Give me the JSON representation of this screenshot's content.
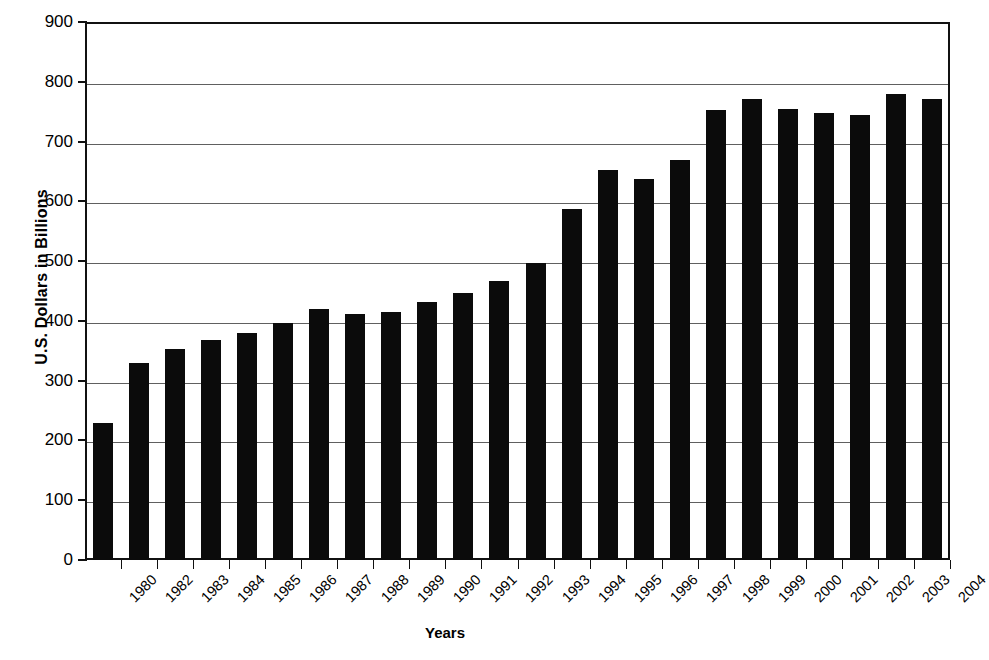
{
  "chart_data": {
    "type": "bar",
    "title": "",
    "xlabel": "Years",
    "ylabel": "U.S. Dollars in Billions",
    "ylim": [
      0,
      900
    ],
    "ytick_step": 100,
    "yticks": [
      900,
      800,
      700,
      600,
      500,
      400,
      300,
      200,
      100,
      0
    ],
    "grid": true,
    "legend": "none",
    "bar_color": "#0b0b0b",
    "categories": [
      "1980",
      "1982",
      "1983",
      "1984",
      "1985",
      "1986",
      "1987",
      "1988",
      "1989",
      "1990",
      "1991",
      "1992",
      "1993",
      "1994",
      "1995",
      "1996",
      "1997",
      "1998",
      "1999",
      "2000",
      "2001",
      "2002",
      "2003",
      "2004"
    ],
    "values": [
      230,
      330,
      353,
      368,
      380,
      396,
      420,
      412,
      415,
      432,
      447,
      466,
      497,
      588,
      652,
      638,
      670,
      752,
      771,
      754,
      748,
      745,
      779,
      772
    ]
  }
}
